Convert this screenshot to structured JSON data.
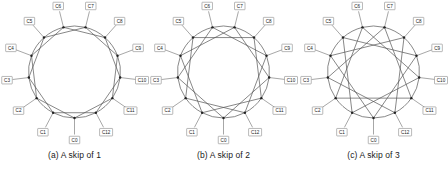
{
  "figure": {
    "background_color": "#ffffff",
    "node_count": 13,
    "node_labels": [
      "C0",
      "C1",
      "C2",
      "C3",
      "C4",
      "C5",
      "C6",
      "C7",
      "C8",
      "C9",
      "C10",
      "C11",
      "C12"
    ],
    "line_color": "#555555",
    "node_color": "#222222",
    "label_border_color": "#8a8a8a"
  },
  "panels": [
    {
      "id": "panel-a",
      "caption": "(a) A skip of 1",
      "skip": 1,
      "chord_step": 2,
      "labels": [
        "C0",
        "C1",
        "C2",
        "C3",
        "C4",
        "C5",
        "C6",
        "C7",
        "C8",
        "C9",
        "C10",
        "C11",
        "C12"
      ]
    },
    {
      "id": "panel-b",
      "caption": "(b) A skip of 2",
      "skip": 2,
      "chord_step": 3,
      "labels": [
        "C0",
        "C1",
        "C2",
        "C3",
        "C4",
        "C5",
        "C6",
        "C7",
        "C8",
        "C9",
        "C10",
        "C11",
        "C12"
      ]
    },
    {
      "id": "panel-c",
      "caption": "(c) A skip of 3",
      "skip": 3,
      "chord_step": 4,
      "labels": [
        "C0",
        "C1",
        "C2",
        "C3",
        "C4",
        "C5",
        "C6",
        "C7",
        "C8",
        "C9",
        "C10",
        "C11",
        "C12"
      ]
    }
  ],
  "chart_data": {
    "type": "diagram",
    "title": "",
    "graphs": [
      {
        "name": "(a) A skip of 1",
        "skip": 1,
        "nodes": [
          "C0",
          "C1",
          "C2",
          "C3",
          "C4",
          "C5",
          "C6",
          "C7",
          "C8",
          "C9",
          "C10",
          "C11",
          "C12"
        ],
        "ring_edges": [
          [
            0,
            1
          ],
          [
            1,
            2
          ],
          [
            2,
            3
          ],
          [
            3,
            4
          ],
          [
            4,
            5
          ],
          [
            5,
            6
          ],
          [
            6,
            7
          ],
          [
            7,
            8
          ],
          [
            8,
            9
          ],
          [
            9,
            10
          ],
          [
            10,
            11
          ],
          [
            11,
            12
          ],
          [
            12,
            0
          ]
        ],
        "chord_edges": [
          [
            0,
            2
          ],
          [
            1,
            3
          ],
          [
            2,
            4
          ],
          [
            3,
            5
          ],
          [
            4,
            6
          ],
          [
            5,
            7
          ],
          [
            6,
            8
          ],
          [
            7,
            9
          ],
          [
            8,
            10
          ],
          [
            9,
            11
          ],
          [
            10,
            12
          ],
          [
            11,
            0
          ],
          [
            12,
            1
          ]
        ]
      },
      {
        "name": "(b) A skip of 2",
        "skip": 2,
        "nodes": [
          "C0",
          "C1",
          "C2",
          "C3",
          "C4",
          "C5",
          "C6",
          "C7",
          "C8",
          "C9",
          "C10",
          "C11",
          "C12"
        ],
        "ring_edges": [
          [
            0,
            1
          ],
          [
            1,
            2
          ],
          [
            2,
            3
          ],
          [
            3,
            4
          ],
          [
            4,
            5
          ],
          [
            5,
            6
          ],
          [
            6,
            7
          ],
          [
            7,
            8
          ],
          [
            8,
            9
          ],
          [
            9,
            10
          ],
          [
            10,
            11
          ],
          [
            11,
            12
          ],
          [
            12,
            0
          ]
        ],
        "chord_edges": [
          [
            0,
            3
          ],
          [
            1,
            4
          ],
          [
            2,
            5
          ],
          [
            3,
            6
          ],
          [
            4,
            7
          ],
          [
            5,
            8
          ],
          [
            6,
            9
          ],
          [
            7,
            10
          ],
          [
            8,
            11
          ],
          [
            9,
            12
          ],
          [
            10,
            0
          ],
          [
            11,
            1
          ],
          [
            12,
            2
          ]
        ]
      },
      {
        "name": "(c) A skip of 3",
        "skip": 3,
        "nodes": [
          "C0",
          "C1",
          "C2",
          "C3",
          "C4",
          "C5",
          "C6",
          "C7",
          "C8",
          "C9",
          "C10",
          "C11",
          "C12"
        ],
        "ring_edges": [
          [
            0,
            1
          ],
          [
            1,
            2
          ],
          [
            2,
            3
          ],
          [
            3,
            4
          ],
          [
            4,
            5
          ],
          [
            5,
            6
          ],
          [
            6,
            7
          ],
          [
            7,
            8
          ],
          [
            8,
            9
          ],
          [
            9,
            10
          ],
          [
            10,
            11
          ],
          [
            11,
            12
          ],
          [
            12,
            0
          ]
        ],
        "chord_edges": [
          [
            0,
            4
          ],
          [
            1,
            5
          ],
          [
            2,
            6
          ],
          [
            3,
            7
          ],
          [
            4,
            8
          ],
          [
            5,
            9
          ],
          [
            6,
            10
          ],
          [
            7,
            11
          ],
          [
            8,
            12
          ],
          [
            9,
            0
          ],
          [
            10,
            1
          ],
          [
            11,
            2
          ],
          [
            12,
            3
          ]
        ]
      }
    ]
  }
}
